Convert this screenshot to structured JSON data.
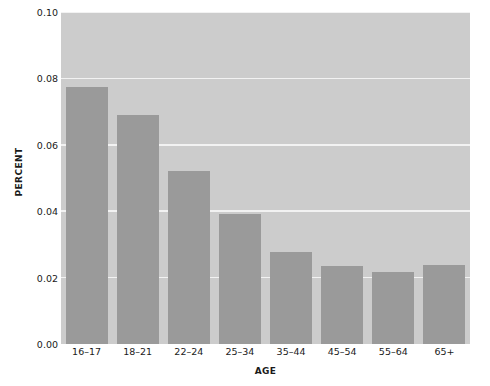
{
  "chart_data": {
    "type": "bar",
    "title": "",
    "xlabel": "AGE",
    "ylabel": "PERCENT",
    "categories": [
      "16–17",
      "18–21",
      "22–24",
      "25–34",
      "35–44",
      "45–54",
      "55–64",
      "65+"
    ],
    "values": [
      0.0775,
      0.069,
      0.052,
      0.0392,
      0.0278,
      0.0236,
      0.0218,
      0.0238
    ],
    "ylim": [
      0.0,
      0.1
    ],
    "ytick_values": [
      0.0,
      0.02,
      0.04,
      0.06,
      0.08,
      0.1
    ],
    "ytick_labels": [
      "0.00",
      "0.02",
      "0.04",
      "0.06",
      "0.08",
      "0.10"
    ],
    "grid": true,
    "grid_axis": "y",
    "legend": false,
    "bar_color": "#9a9a9a",
    "plot_background": "#cccccc",
    "gridline_color": "#f2f2f2",
    "figure_background": "#ffffff"
  }
}
